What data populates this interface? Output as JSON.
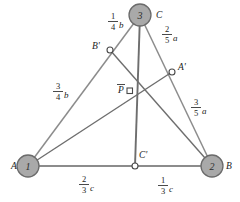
{
  "figure": {
    "colors": {
      "vertex_fill": "#a9a9a9",
      "vertex_stroke": "#6b6b6b",
      "edge_stroke": "#8c8c8c",
      "cevian_stroke": "#6e6e6e",
      "marker_fill": "#ffffff",
      "marker_stroke": "#4a4a4a",
      "text": "#1c1c1c"
    },
    "vertices": [
      {
        "id": "A",
        "label": "A",
        "number": "1",
        "x": 28,
        "y": 166,
        "r": 11,
        "label_dx": -17,
        "label_dy": 0
      },
      {
        "id": "B",
        "label": "B",
        "number": "2",
        "x": 212,
        "y": 166,
        "r": 11,
        "label_dx": 16,
        "label_dy": 0
      },
      {
        "id": "C",
        "label": "C",
        "number": "3",
        "x": 140,
        "y": 15,
        "r": 11,
        "label_dx": 16,
        "label_dy": -1
      }
    ],
    "division_points": [
      {
        "id": "Aprime",
        "label": "A'",
        "x": 172,
        "y": 72,
        "r": 3,
        "label_dx": 6,
        "label_dy": -4
      },
      {
        "id": "Bprime",
        "label": "B'",
        "x": 110,
        "y": 50,
        "r": 3,
        "label_dx": -18,
        "label_dy": -2
      },
      {
        "id": "Cprime",
        "label": "C'",
        "x": 135,
        "y": 166,
        "r": 3,
        "label_dx": 4,
        "label_dy": -9
      }
    ],
    "center_point": {
      "id": "P",
      "label": "P",
      "x": 130,
      "y": 91,
      "size": 5,
      "label_dx": -12,
      "label_dy": -1
    },
    "segment_labels": [
      {
        "id": "cb-quarter",
        "numerator": "1",
        "denominator": "4",
        "variable": "b",
        "x": 113,
        "y": 22,
        "segment": "C to B'"
      },
      {
        "id": "ba-three-quarter",
        "numerator": "3",
        "denominator": "4",
        "variable": "b",
        "x": 58,
        "y": 92,
        "segment": "B' to A"
      },
      {
        "id": "ca-two-fifth",
        "numerator": "2",
        "denominator": "5",
        "variable": "a",
        "x": 167,
        "y": 35,
        "segment": "C to A'"
      },
      {
        "id": "ab-three-fifth",
        "numerator": "3",
        "denominator": "5",
        "variable": "a",
        "x": 196,
        "y": 108,
        "segment": "A' to B"
      },
      {
        "id": "ac-two-third",
        "numerator": "2",
        "denominator": "3",
        "variable": "c",
        "x": 84,
        "y": 185,
        "segment": "A to C'"
      },
      {
        "id": "cb-one-third",
        "numerator": "1",
        "denominator": "3",
        "variable": "c",
        "x": 163,
        "y": 186,
        "segment": "C' to B"
      }
    ]
  }
}
